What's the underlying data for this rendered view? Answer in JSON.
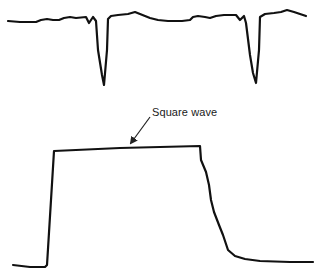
{
  "diagram": {
    "top_trace": {
      "description": "Baseline signal with two sharp downward spikes",
      "points": "8,21 20,22 36,22 41,20 47,19 53,20 59,20 64,18 70,17 76,18 86,17 89,23 93,17 96,21 98,50 102,75 104,85 107,50 108,19 111,16 118,15 128,14 135,12 140,14 150,18 158,20 168,21 182,21 190,20 193,17 198,16 205,17 210,18 216,16 224,15 236,15 240,20 244,16 246,23 250,55 253,73 256,83 259,50 260,17 265,14 274,13 281,12 287,10 294,12 306,16",
      "stroke": "#111111"
    },
    "square_wave": {
      "label": "Square wave",
      "points": "13,265 30,267 45,267 47,265 51,200 54,151 120,148 200,146 201,160 206,172 209,185 211,200 214,212 219,225 223,235 228,250 235,256 245,259 260,261 290,262 313,262",
      "stroke": "#111111"
    },
    "annotation": {
      "text": "Square wave",
      "arrow_from": [
        150,
        117
      ],
      "arrow_to": [
        130,
        144
      ]
    }
  }
}
